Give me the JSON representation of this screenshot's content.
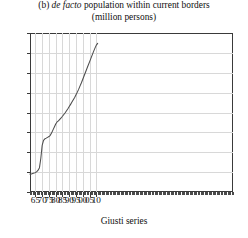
{
  "chart_data": {
    "type": "line",
    "title": "(b) de facto population within current borders (million persons)",
    "title_line1_pre": "(b) ",
    "title_line1_italic": "de facto",
    "title_line1_post": " population within current borders",
    "title_line2": "(million persons)",
    "xlabel": "Giusti series",
    "ylabel": "",
    "xlim": [
      1861,
      2011
    ],
    "ylim": [
      20,
      36
    ],
    "grid": true,
    "legend": null,
    "y_ticks": [
      20,
      22,
      24,
      26,
      28,
      30,
      32,
      34,
      36
    ],
    "y_tick_labels": [
      "20",
      "22",
      "24",
      "26",
      "28",
      "30",
      "32",
      "34",
      "36"
    ],
    "x_ticks": [
      1865,
      1870,
      1875,
      1880,
      1885,
      1890,
      1895,
      1900,
      1905,
      1910
    ],
    "x_tick_labels": [
      "65",
      "70",
      "75",
      "80",
      "85",
      "90",
      "95",
      "00",
      "05",
      "10"
    ],
    "x_minor_tick_step": 1,
    "series_name": "Giusti series",
    "series_color": "#4d4d4d",
    "x": [
      1861,
      1862,
      1863,
      1864,
      1865,
      1866,
      1867,
      1868,
      1869,
      1870,
      1871,
      1872,
      1873,
      1874,
      1875,
      1876,
      1877,
      1878,
      1879,
      1880,
      1881,
      1882,
      1883,
      1884,
      1885,
      1886,
      1887,
      1888,
      1889,
      1890,
      1891,
      1892,
      1893,
      1894,
      1895,
      1896,
      1897,
      1898,
      1899,
      1900,
      1901,
      1902,
      1903,
      1904,
      1905,
      1906,
      1907,
      1908,
      1909,
      1910,
      1911
    ],
    "values": [
      21.8,
      21.82,
      21.86,
      21.9,
      21.95,
      22.05,
      22.2,
      22.45,
      23.4,
      24.7,
      25.2,
      25.35,
      25.42,
      25.5,
      25.58,
      25.7,
      25.95,
      26.25,
      26.55,
      26.85,
      27.05,
      27.15,
      27.3,
      27.45,
      27.62,
      27.8,
      27.98,
      28.18,
      28.38,
      28.6,
      28.82,
      29.05,
      29.28,
      29.52,
      29.78,
      30.05,
      30.35,
      30.68,
      31.0,
      31.35,
      31.7,
      32.05,
      32.4,
      32.75,
      33.1,
      33.45,
      33.8,
      34.15,
      34.48,
      34.78,
      34.95
    ]
  }
}
